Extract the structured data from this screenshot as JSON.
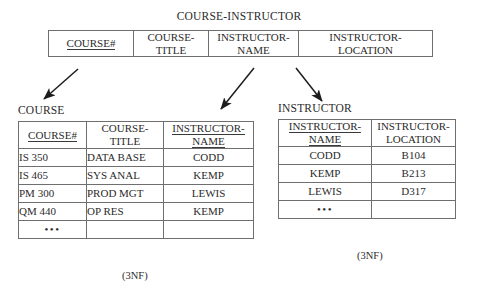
{
  "diagram": {
    "parent_relation": {
      "name": "COURSE-INSTRUCTOR",
      "attributes": [
        {
          "lines": [
            "COURSE#"
          ],
          "key": true
        },
        {
          "lines": [
            "COURSE-",
            "TITLE"
          ],
          "key": false
        },
        {
          "lines": [
            "INSTRUCTOR-",
            "NAME"
          ],
          "key": false
        },
        {
          "lines": [
            "INSTRUCTOR-",
            "LOCATION"
          ],
          "key": false
        }
      ]
    },
    "course_relation": {
      "name": "COURSE",
      "normal_form": "(3NF)",
      "attributes": [
        {
          "lines": [
            "COURSE#"
          ],
          "key": true
        },
        {
          "lines": [
            "COURSE-",
            "TITLE"
          ],
          "key": false
        },
        {
          "lines": [
            "INSTRUCTOR-",
            "NAME"
          ],
          "key": true
        }
      ],
      "rows": [
        [
          "IS 350",
          "DATA BASE",
          "CODD"
        ],
        [
          "IS 465",
          "SYS ANAL",
          "KEMP"
        ],
        [
          "PM 300",
          "PROD MGT",
          "LEWIS"
        ],
        [
          "QM 440",
          "OP RES",
          "KEMP"
        ]
      ],
      "ellipsis_row": "•••"
    },
    "instructor_relation": {
      "name": "INSTRUCTOR",
      "normal_form": "(3NF)",
      "attributes": [
        {
          "lines": [
            "INSTRUCTOR-",
            "NAME"
          ],
          "key": true
        },
        {
          "lines": [
            "INSTRUCTOR-",
            "LOCATION"
          ],
          "key": false
        }
      ],
      "rows": [
        [
          "CODD",
          "B104"
        ],
        [
          "KEMP",
          "B213"
        ],
        [
          "LEWIS",
          "D317"
        ]
      ],
      "ellipsis_row": "•••"
    },
    "arrows": [
      {
        "name": "arrow-course-number-to-course",
        "from": [
          78,
          69
        ],
        "to": [
          44,
          99
        ]
      },
      {
        "name": "arrow-instructor-name-to-course",
        "from": [
          254,
          68
        ],
        "to": [
          221,
          109
        ]
      },
      {
        "name": "arrow-instructor-name-to-instructor",
        "from": [
          296,
          68
        ],
        "to": [
          322,
          101
        ]
      }
    ],
    "colors": {
      "ink": "#2b2b2b",
      "rule": "#6f6f6f",
      "background": "#ffffff",
      "arrow": "#1d1d1d"
    }
  }
}
